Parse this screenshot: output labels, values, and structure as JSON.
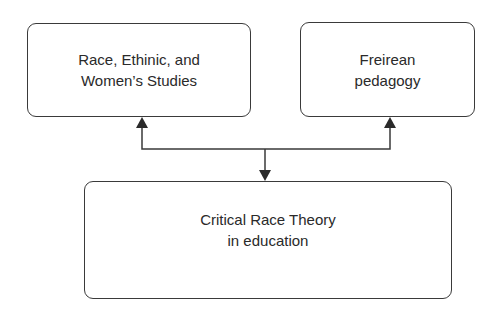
{
  "diagram": {
    "nodes": [
      {
        "id": "rews",
        "lines": [
          "Race, Ethinic, and",
          "Women’s Studies"
        ]
      },
      {
        "id": "freire",
        "lines": [
          "Freirean",
          "pedagogy"
        ]
      },
      {
        "id": "crt",
        "lines": [
          "Critical Race Theory",
          "in education"
        ]
      }
    ],
    "edges": [
      {
        "from": "junction",
        "to": "rews",
        "direction": "up"
      },
      {
        "from": "junction",
        "to": "freire",
        "direction": "up"
      },
      {
        "from": "junction",
        "to": "crt",
        "direction": "down"
      }
    ],
    "colors": {
      "stroke": "#3a3a3a",
      "text": "#2a2a2a",
      "background": "#ffffff"
    }
  }
}
